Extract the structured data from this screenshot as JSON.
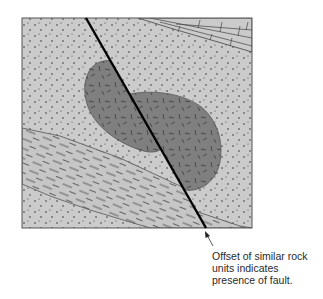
{
  "figure": {
    "units": [
      {
        "name": "sandstone",
        "pattern": "stipple",
        "color": "#cbcbcb"
      },
      {
        "name": "limestone",
        "pattern": "brick",
        "color": "#cbcbcb"
      },
      {
        "name": "shale",
        "pattern": "dashes",
        "color": "#c6c6c6"
      },
      {
        "name": "igneous-body",
        "pattern": "short-dashes",
        "color": "#7f7f7f"
      }
    ],
    "fault": {
      "color": "#000000"
    },
    "border_color": "#555555"
  },
  "annotation": {
    "lines": [
      "Offset of similar rock",
      "units indicates",
      "presence of fault."
    ]
  }
}
